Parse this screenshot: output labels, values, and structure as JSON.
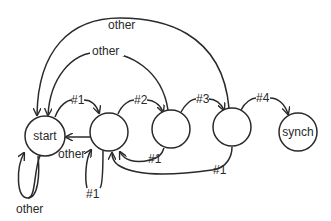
{
  "diagram": {
    "type": "state-machine",
    "nodes": [
      {
        "id": "start",
        "label": "start"
      },
      {
        "id": "s1",
        "label": ""
      },
      {
        "id": "s2",
        "label": ""
      },
      {
        "id": "s3",
        "label": ""
      },
      {
        "id": "synch",
        "label": "synch"
      }
    ],
    "edges": [
      {
        "from": "start",
        "to": "s1",
        "label": "#1"
      },
      {
        "from": "s1",
        "to": "s2",
        "label": "#2"
      },
      {
        "from": "s2",
        "to": "s3",
        "label": "#3"
      },
      {
        "from": "s3",
        "to": "synch",
        "label": "#4"
      },
      {
        "from": "s3",
        "to": "start",
        "label": "other"
      },
      {
        "from": "s2",
        "to": "start",
        "label": "other"
      },
      {
        "from": "s1",
        "to": "start",
        "label": "other"
      },
      {
        "from": "start",
        "to": "start",
        "label": "other"
      },
      {
        "from": "s1",
        "to": "s1",
        "label": "#1"
      },
      {
        "from": "s2",
        "to": "s1",
        "label": "#1"
      },
      {
        "from": "s3",
        "to": "s1",
        "label": "#1"
      }
    ]
  },
  "labels": {
    "start": "start",
    "synch": "synch",
    "e_h1": "#1",
    "e_h2": "#2",
    "e_h3": "#3",
    "e_h4": "#4",
    "e_other_outer": "other",
    "e_other_inner": "other",
    "e_other_s1": "other",
    "e_other_self": "other",
    "e_self_s1": "#1",
    "e_s2_s1": "#1",
    "e_s3_s1": "#1"
  }
}
